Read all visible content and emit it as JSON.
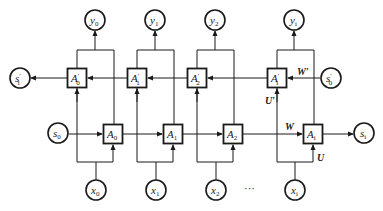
{
  "diagram": {
    "type": "bidirectional-rnn",
    "outputs": [
      {
        "base": "y",
        "sub": "0"
      },
      {
        "base": "y",
        "sub": "1"
      },
      {
        "base": "y",
        "sub": "2"
      },
      {
        "base": "y",
        "sub": "i"
      }
    ],
    "inputs": [
      {
        "base": "x",
        "sub": "0"
      },
      {
        "base": "x",
        "sub": "1"
      },
      {
        "base": "x",
        "sub": "2"
      },
      {
        "base": "x",
        "sub": "i"
      }
    ],
    "backward_cells": [
      {
        "base": "A",
        "prime": "′",
        "sub": "0"
      },
      {
        "base": "A",
        "prime": "′",
        "sub": "1"
      },
      {
        "base": "A",
        "prime": "′",
        "sub": "2"
      },
      {
        "base": "A",
        "prime": "′",
        "sub": "i"
      }
    ],
    "forward_cells": [
      {
        "base": "A",
        "sub": "0"
      },
      {
        "base": "A",
        "sub": "1"
      },
      {
        "base": "A",
        "sub": "2"
      },
      {
        "base": "A",
        "sub": "i"
      }
    ],
    "states": {
      "forward_start": {
        "base": "s",
        "sub": "0"
      },
      "forward_end": {
        "base": "s",
        "sub": "i"
      },
      "backward_start": {
        "base": "s",
        "prime": "′",
        "sub": "0"
      },
      "backward_end": {
        "base": "s",
        "prime": "′",
        "sub": "i"
      }
    },
    "weights": {
      "W": "W",
      "U": "U",
      "W_prime": "W′",
      "U_prime": "U′"
    },
    "ellipsis": "···"
  }
}
